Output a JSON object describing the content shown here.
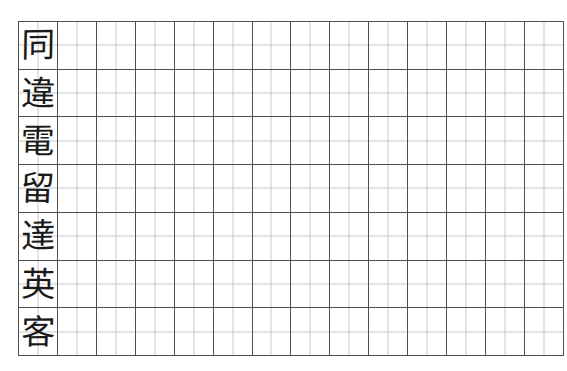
{
  "worksheet": {
    "type": "chinese-character-handwriting-practice-sheet",
    "grid": {
      "columns": 14,
      "rows": 7,
      "cell_style": "tian-zi-ge",
      "border_color": "#4f4f4f",
      "guide_color": "#c9c9c9",
      "background_color": "#ffffff",
      "ink_color": "#1a1a1a"
    },
    "written_column_index": 1,
    "characters": [
      {
        "row": 1,
        "char": "同"
      },
      {
        "row": 2,
        "char": "違"
      },
      {
        "row": 3,
        "char": "電"
      },
      {
        "row": 4,
        "char": "留"
      },
      {
        "row": 5,
        "char": "達"
      },
      {
        "row": 6,
        "char": "英"
      },
      {
        "row": 7,
        "char": "客"
      }
    ]
  }
}
